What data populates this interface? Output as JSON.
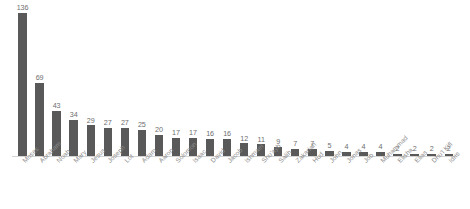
{
  "chart_data": {
    "type": "bar",
    "title": "",
    "subtitle": "",
    "xlabel": "",
    "ylabel": "",
    "grid": false,
    "legend": false,
    "ylim": [
      0,
      136
    ],
    "axis_line": true,
    "bar_color": "#595959",
    "value_label_color": "#6e6e6e",
    "tick_label_color": "#8c8c8c",
    "tick_label_rotation": -45,
    "categories": [
      "Moses",
      "Abraham",
      "Noah",
      "Mary",
      "Jesus",
      "Joseph",
      "Lot",
      "Adam",
      "Aaron",
      "Solomon",
      "Isaac",
      "David",
      "Jacob",
      "Ishmael",
      "Shu'ayb",
      "Salih",
      "Zakariah",
      "Hud",
      "John",
      "Jonas",
      "Job",
      "Muhammad",
      "Elisha",
      "Elias",
      "Dhu'l Kifl",
      "Idris"
    ],
    "values": [
      136,
      69,
      43,
      34,
      29,
      27,
      27,
      25,
      20,
      17,
      17,
      16,
      16,
      12,
      11,
      9,
      7,
      7,
      5,
      4,
      4,
      4,
      2,
      2,
      2,
      2
    ],
    "value_labels": [
      "136",
      "69",
      "43",
      "34",
      "29",
      "27",
      "27",
      "25",
      "20",
      "17",
      "17",
      "16",
      "16",
      "12",
      "11",
      "9",
      "7",
      "7",
      "5",
      "4",
      "4",
      "4",
      "2",
      "2",
      "2",
      "2"
    ]
  }
}
